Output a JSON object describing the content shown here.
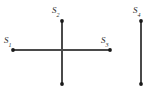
{
  "figure": {
    "type": "line-segment-diagram",
    "background_color": "#ffffff",
    "line_color": "#4a4a4a",
    "dot_color": "#1a1a1a",
    "label_color": "#2b2b2b",
    "labels": [
      {
        "id": "s1",
        "base": "S",
        "subscript": "1",
        "position": "left-of-cross"
      },
      {
        "id": "s2",
        "base": "S",
        "subscript": "2",
        "position": "top-of-cross"
      },
      {
        "id": "s3",
        "base": "S",
        "subscript": "3",
        "position": "right-of-cross"
      },
      {
        "id": "s4",
        "base": "S",
        "subscript": "4",
        "position": "top-of-isolated-segment"
      }
    ],
    "segments": [
      {
        "name": "horizontal-bar",
        "x1": 13,
        "y1": 50,
        "x2": 110,
        "y2": 50
      },
      {
        "name": "vertical-bar",
        "x1": 62,
        "y1": 21,
        "x2": 62,
        "y2": 84
      },
      {
        "name": "isolated-vertical-bar",
        "x1": 141,
        "y1": 21,
        "x2": 141,
        "y2": 84
      }
    ],
    "endpoints": [
      {
        "name": "endpoint-s1",
        "cx": 13,
        "cy": 50
      },
      {
        "name": "endpoint-s3",
        "cx": 110,
        "cy": 50
      },
      {
        "name": "endpoint-s2",
        "cx": 62,
        "cy": 21
      },
      {
        "name": "endpoint-bottom",
        "cx": 62,
        "cy": 84
      },
      {
        "name": "endpoint-s4",
        "cx": 141,
        "cy": 21
      },
      {
        "name": "endpoint-isolated-bottom",
        "cx": 141,
        "cy": 84
      }
    ]
  }
}
